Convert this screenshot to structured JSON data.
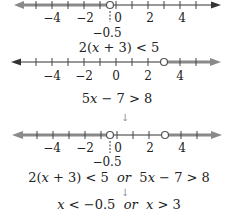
{
  "colors": {
    "solution": "#8a8a8a",
    "axis": "#333333",
    "circle_fill": "#ffffff"
  },
  "number_lines": [
    {
      "id": "line1",
      "tick_labels": [
        "−4",
        "−2",
        "0",
        "2",
        "4"
      ],
      "extra_label": "−0.5",
      "open_circle_at": -0.5,
      "shaded": "left",
      "inequality": "2(x + 3) < 5"
    },
    {
      "id": "line2",
      "tick_labels": [
        "−4",
        "−2",
        "0",
        "2",
        "4"
      ],
      "open_circle_at": 3,
      "shaded": "right",
      "inequality": "5x − 7 > 8"
    },
    {
      "id": "line3",
      "tick_labels": [
        "−4",
        "−2",
        "0",
        "2",
        "4"
      ],
      "extra_label": "−0.5",
      "open_circles_at": [
        -0.5,
        3
      ],
      "shaded": "both-outside",
      "inequality": "2(x + 3) < 5  or  5x − 7 > 8"
    }
  ],
  "arrows": [
    "↓",
    "↓"
  ],
  "result": "x < −0.5  or  x > 3",
  "text": {
    "line1_ticks": {
      "a": "−4",
      "b": "−2",
      "c": "0",
      "d": "2",
      "e": "4"
    },
    "line1_extra": "−0.5",
    "line1_eq": {
      "pre": "2(",
      "x": "x",
      "post": " + 3) < 5"
    },
    "line2_ticks": {
      "a": "−4",
      "b": "−2",
      "c": "0",
      "d": "2",
      "e": "4"
    },
    "line2_eq": {
      "pre": "5",
      "x": "x",
      "post": " − 7 > 8"
    },
    "line3_ticks": {
      "a": "−4",
      "b": "−2",
      "c": "0",
      "d": "2",
      "e": "4"
    },
    "line3_extra": "−0.5",
    "line3_eq": {
      "p1": "2(",
      "x1": "x",
      "p2": " + 3) < 5  ",
      "or": "or",
      "p3": "  5",
      "x2": "x",
      "p4": " − 7 > 8"
    },
    "arrow1": "↓",
    "arrow2": "↓",
    "result": {
      "x1": "x",
      "p1": " < −0.5  ",
      "or": "or",
      "p2": "  ",
      "x2": "x",
      "p3": " > 3"
    }
  }
}
